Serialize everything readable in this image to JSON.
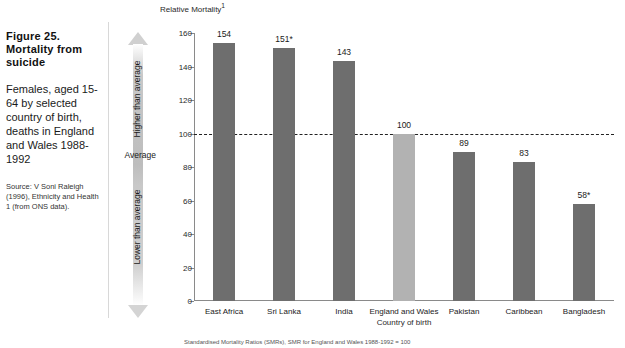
{
  "caption": {
    "title": "Figure 25. Mortality from suicide",
    "subtitle": "Females, aged 15-64 by selected country of birth, deaths in England and Wales 1988-1992",
    "source": "Source: V Soni Raleigh (1996), Ethnicity and Health 1 (from ONS data)."
  },
  "annotation": {
    "higher_label": "Higher than average",
    "average_label": "Average",
    "lower_label": "Lower than average"
  },
  "colors": {
    "bar": "#6e6e6e",
    "highlight_bar": "#b2b2b2",
    "axis": "#8a8a8a",
    "average_line": "#222222"
  },
  "chart_data": {
    "type": "bar",
    "title": "Figure 25. Mortality from suicide",
    "subtitle": "Females, aged 15-64 by selected country of birth, deaths in England and Wales 1988-1992",
    "xlabel": "Country of birth",
    "ylabel": "Relative Mortality",
    "ylabel_superscript": "1",
    "ylim": [
      0,
      160
    ],
    "yticks": [
      0,
      20,
      40,
      60,
      80,
      100,
      120,
      140,
      160
    ],
    "grid": false,
    "legend": "none",
    "reference_line": {
      "value": 100,
      "style": "dashed",
      "label": "Average"
    },
    "categories": [
      "East Africa",
      "Sri Lanka",
      "India",
      "England and Wales",
      "Pakistan",
      "Caribbean",
      "Bangladesh"
    ],
    "values": [
      154,
      151,
      143,
      100,
      89,
      83,
      58
    ],
    "value_labels": [
      "154",
      "151*",
      "143",
      "100",
      "89",
      "83",
      "58*"
    ],
    "highlight_index": 3,
    "footnote": "Standardised Mortality Ratios (SMRs), SMR for England and Wales 1988-1992 = 100"
  }
}
